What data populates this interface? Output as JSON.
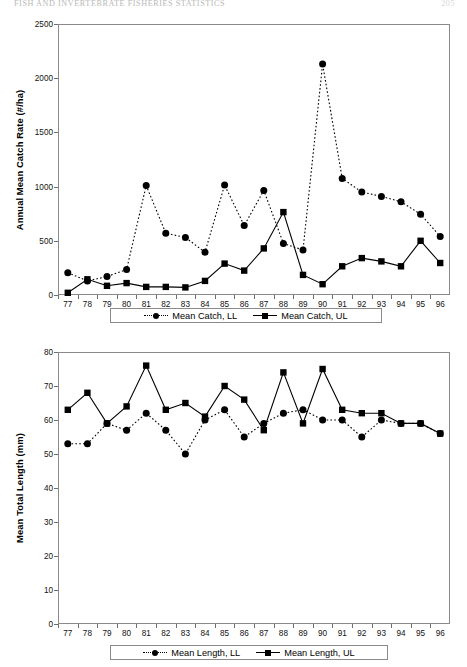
{
  "header": {
    "running_head": "FISH AND INVERTEBRATE FISHERIES STATISTICS",
    "folio": "205"
  },
  "chart_data": [
    {
      "id": "catch-rate",
      "type": "line",
      "title": "",
      "xlabel": "",
      "ylabel": "Annual Mean Catch Rate (#/ha)",
      "ylim": [
        0,
        2500
      ],
      "yticks": [
        0,
        500,
        1000,
        1500,
        2000,
        2500
      ],
      "grid": false,
      "legend_position": "bottom",
      "categories": [
        "77",
        "78",
        "79",
        "80",
        "81",
        "82",
        "83",
        "84",
        "85",
        "86",
        "87",
        "88",
        "89",
        "90",
        "91",
        "92",
        "93",
        "94",
        "95",
        "96"
      ],
      "series": [
        {
          "name": "Mean Catch, LL",
          "marker": "circle",
          "line": "dotted",
          "values": [
            205,
            130,
            170,
            235,
            1010,
            570,
            530,
            395,
            1015,
            640,
            965,
            475,
            415,
            2130,
            1075,
            950,
            910,
            860,
            745,
            540
          ]
        },
        {
          "name": "Mean Catch, UL",
          "marker": "square",
          "line": "solid",
          "values": [
            20,
            145,
            85,
            110,
            75,
            75,
            70,
            130,
            290,
            225,
            430,
            765,
            185,
            100,
            265,
            340,
            310,
            265,
            500,
            295
          ]
        }
      ]
    },
    {
      "id": "total-length",
      "type": "line",
      "title": "",
      "xlabel": "",
      "ylabel": "Mean Total Length (mm)",
      "ylim": [
        0,
        80
      ],
      "yticks": [
        0,
        10,
        20,
        30,
        40,
        50,
        60,
        70,
        80
      ],
      "grid": false,
      "legend_position": "bottom",
      "categories": [
        "77",
        "78",
        "79",
        "80",
        "81",
        "82",
        "83",
        "84",
        "85",
        "86",
        "87",
        "88",
        "89",
        "90",
        "91",
        "92",
        "93",
        "94",
        "95",
        "96"
      ],
      "series": [
        {
          "name": "Mean Length, LL",
          "marker": "circle",
          "line": "dotted",
          "values": [
            53,
            53,
            59,
            57,
            62,
            57,
            50,
            60,
            63,
            55,
            59,
            62,
            63,
            60,
            60,
            55,
            60,
            59,
            59,
            56
          ]
        },
        {
          "name": "Mean Length, UL",
          "marker": "square",
          "line": "solid",
          "values": [
            63,
            68,
            59,
            64,
            76,
            63,
            65,
            61,
            70,
            66,
            57,
            74,
            59,
            75,
            63,
            62,
            62,
            59,
            59,
            56
          ]
        }
      ]
    }
  ]
}
